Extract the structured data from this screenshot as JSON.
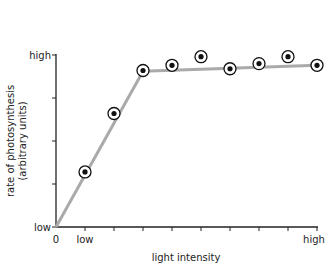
{
  "chart_data": {
    "type": "line",
    "title": "",
    "xlabel": "light intensity",
    "ylabel_line1": "rate of photosynthesis",
    "ylabel_line2": "(arbitrary units)",
    "x_tick_labels": {
      "origin": "0",
      "low": "low",
      "high": "high"
    },
    "y_tick_labels": {
      "low": "low",
      "high": "high"
    },
    "x": [
      1,
      2,
      3,
      4,
      5,
      6,
      7,
      8,
      9
    ],
    "values": [
      32,
      66,
      91,
      94,
      99,
      92,
      95,
      99,
      94
    ],
    "trend_line": [
      [
        0,
        0
      ],
      [
        3,
        90.5
      ],
      [
        9,
        94
      ]
    ],
    "xlim": [
      0,
      9
    ],
    "ylim": [
      0,
      100
    ],
    "x_ticks": [
      1,
      2,
      3,
      4,
      5,
      6,
      7,
      8,
      9
    ],
    "y_ticks": [
      0,
      25,
      50,
      75,
      100
    ],
    "grid": false,
    "legend": null
  },
  "colors": {
    "line": "#aaaaaa",
    "axis": "#222222",
    "marker": "#111111"
  }
}
